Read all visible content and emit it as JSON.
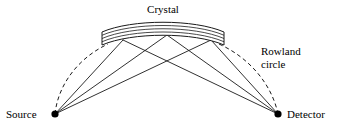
{
  "figure": {
    "title_label": "Crystal",
    "source_label": "Source",
    "detector_label": "Detector",
    "rowland_label_line1": "Rowland",
    "rowland_label_line2": "circle",
    "colors": {
      "background": "#ffffff",
      "ink": "#1a1a1a",
      "dot": "#000000"
    }
  },
  "geometry": {
    "source_point": {
      "x": 55,
      "y": 114
    },
    "detector_point": {
      "x": 278,
      "y": 114
    },
    "crystal_reflection_points": [
      {
        "x": 123,
        "y": 40
      },
      {
        "x": 167,
        "y": 35
      },
      {
        "x": 211,
        "y": 40
      }
    ],
    "crystal_band": {
      "left_x": 102,
      "right_x": 224,
      "apex_top_y": 21,
      "apex_bottom_y": 34,
      "edge_top_y": 32,
      "edge_bottom_y": 45,
      "internal_arc_count": 4
    },
    "rowland_circle": {
      "style": "dashed",
      "left_arc_from": "source_point",
      "left_arc_to": {
        "x": 108,
        "y": 44
      },
      "right_arc_from": {
        "x": 219,
        "y": 44
      },
      "right_arc_to": "detector_point"
    },
    "label_positions": {
      "crystal": {
        "x": 163,
        "y": 13
      },
      "source": {
        "x": 6,
        "y": 118
      },
      "detector": {
        "x": 287,
        "y": 118
      },
      "rowland": {
        "x": 261,
        "y": 55
      }
    }
  }
}
